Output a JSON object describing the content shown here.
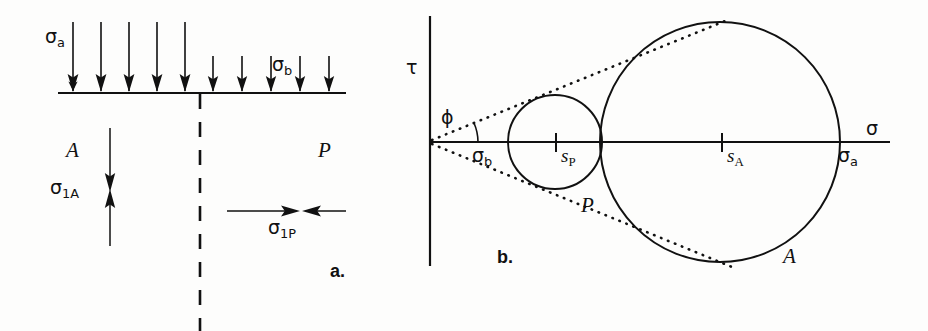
{
  "figure": {
    "kind": "two-panel engineering diagram",
    "background_color": "#fdfdfc",
    "ink_color": "#111111"
  },
  "panel_a": {
    "tag": "a.",
    "surcharge_left": {
      "symbol": "σ",
      "subscript": "a"
    },
    "surcharge_right": {
      "symbol": "σ",
      "subscript": "b"
    },
    "zone_left_label": "A",
    "zone_right_label": "P",
    "stress_left": {
      "symbol": "σ",
      "subscript": "1A"
    },
    "stress_right": {
      "symbol": "σ",
      "subscript": "1P"
    },
    "ground_line": {
      "x1": 58,
      "x2": 346,
      "y": 93
    },
    "divider_line": {
      "x": 200,
      "y1": 93,
      "y2": 331
    },
    "long_arrows_x": [
      73,
      101,
      129,
      157,
      185
    ],
    "long_arrow_top_y": 22,
    "short_arrows_x": [
      213,
      242,
      271,
      300,
      329
    ],
    "short_arrow_top_y": 56,
    "vertical_pair": {
      "x": 110,
      "top_y": 128,
      "bottom_y": 246,
      "meet_y": 190
    },
    "horizontal_pair": {
      "y": 211,
      "left_x": 227,
      "right_x": 346,
      "meet_x": 300
    }
  },
  "panel_b": {
    "tag": "b.",
    "axis_vertical_label": "τ",
    "axis_horizontal_label": "σ",
    "angle_label": "ϕ",
    "origin": {
      "x": 430,
      "y": 142
    },
    "tau_axis": {
      "x": 430,
      "y1": 16,
      "y2": 266
    },
    "sigma_axis": {
      "x1": 430,
      "x2": 890,
      "y": 142
    },
    "circle_passive": {
      "cx": 555,
      "cy": 142,
      "r": 47,
      "label": "P"
    },
    "circle_active": {
      "cx": 720,
      "cy": 142,
      "r": 120,
      "label": "A"
    },
    "tick_sp": {
      "x": 556,
      "label_symbol": "s",
      "label_subscript": "P"
    },
    "tick_sa": {
      "x": 722,
      "label_symbol": "s",
      "label_subscript": "A"
    },
    "label_sigma_b": {
      "symbol": "σ",
      "subscript": "b"
    },
    "label_sigma_a": {
      "symbol": "σ",
      "subscript": "a"
    },
    "tangent_upper": {
      "x1": 432,
      "y1": 140,
      "x2": 730,
      "y2": 19
    },
    "tangent_lower": {
      "x1": 432,
      "y1": 144,
      "x2": 732,
      "y2": 267
    },
    "friction_angle_degrees": 22
  }
}
